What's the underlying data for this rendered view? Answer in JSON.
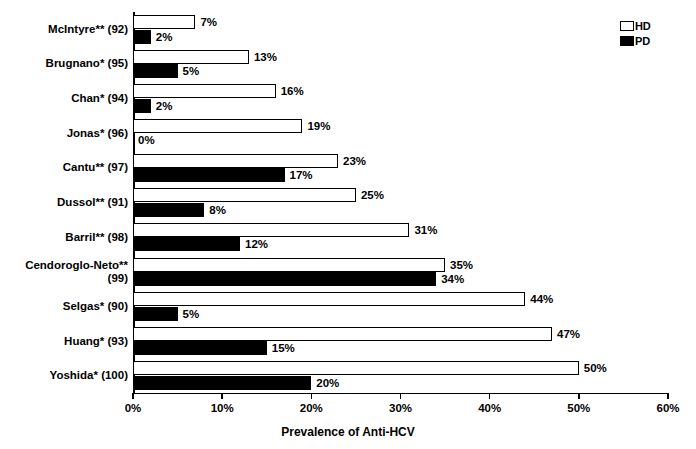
{
  "chart_data": {
    "type": "bar",
    "orientation": "horizontal",
    "title": "",
    "xlabel": "Prevalence of Anti-HCV",
    "ylabel": "",
    "xlim": [
      0,
      60
    ],
    "xtick_labels": [
      "0%",
      "10%",
      "20%",
      "30%",
      "40%",
      "50%",
      "60%"
    ],
    "xticks": [
      0,
      10,
      20,
      30,
      40,
      50,
      60
    ],
    "grid": false,
    "legend_position": "top-right",
    "categories": [
      "McIntyre** (92)",
      "Brugnano* (95)",
      "Chan* (94)",
      "Jonas* (96)",
      "Cantu** (97)",
      "Dussol** (91)",
      "Barril** (98)",
      "Cendoroglo-Neto**\n(99)",
      "Selgas* (90)",
      "Huang* (93)",
      "Yoshida* (100)"
    ],
    "series": [
      {
        "name": "HD",
        "color": "#ffffff",
        "edge_color": "#000000",
        "values": [
          7,
          13,
          16,
          19,
          23,
          25,
          31,
          35,
          44,
          47,
          50
        ],
        "labels": [
          "7%",
          "13%",
          "16%",
          "19%",
          "23%",
          "25%",
          "31%",
          "35%",
          "44%",
          "47%",
          "50%"
        ]
      },
      {
        "name": "PD",
        "color": "#000000",
        "edge_color": "#000000",
        "values": [
          2,
          5,
          2,
          0,
          17,
          8,
          12,
          34,
          5,
          15,
          20
        ],
        "labels": [
          "2%",
          "5%",
          "2%",
          "0%",
          "17%",
          "8%",
          "12%",
          "34%",
          "5%",
          "15%",
          "20%"
        ]
      }
    ]
  },
  "legend": {
    "items": [
      {
        "label": "HD",
        "style": "hollow"
      },
      {
        "label": "PD",
        "style": "filled"
      }
    ]
  },
  "axis": {
    "title": "Prevalence of Anti-HCV"
  }
}
